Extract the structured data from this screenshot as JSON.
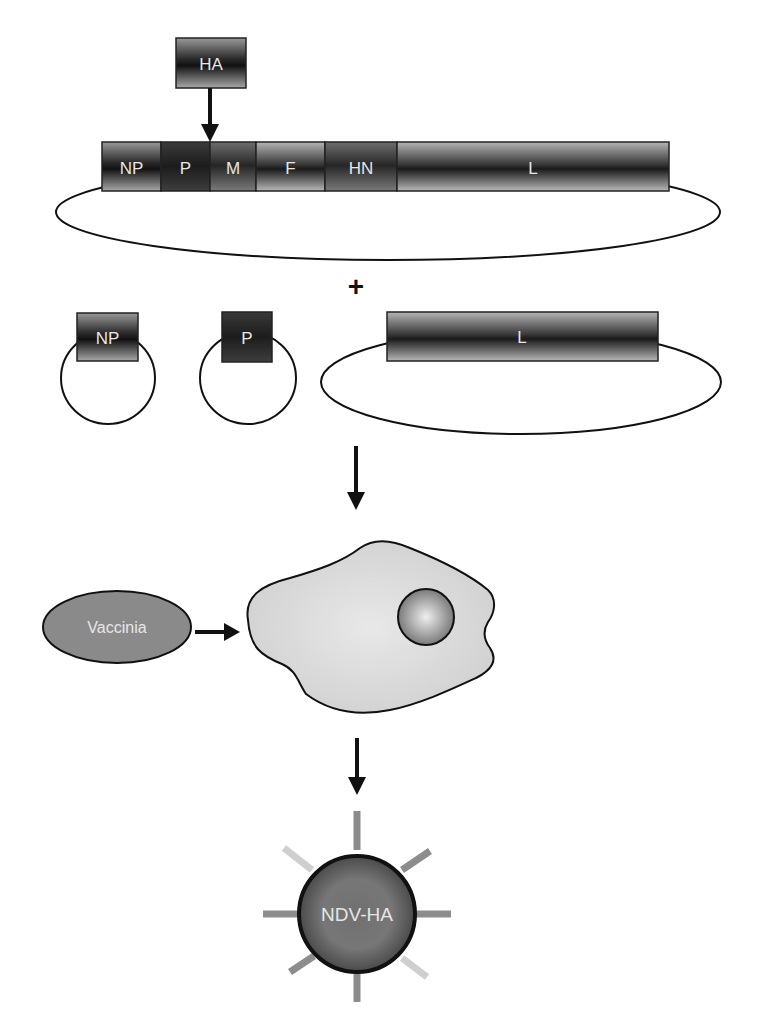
{
  "figure": {
    "insert_gene": {
      "label": "HA"
    },
    "genome_segments": [
      {
        "label": "NP",
        "x": 102,
        "w": 59,
        "shade": "mid"
      },
      {
        "label": "P",
        "x": 161,
        "w": 49,
        "shade": "dark"
      },
      {
        "label": "M",
        "x": 210,
        "w": 46,
        "shade": "darkmid"
      },
      {
        "label": "F",
        "x": 256,
        "w": 69,
        "shade": "light"
      },
      {
        "label": "HN",
        "x": 325,
        "w": 72,
        "shade": "darkmid"
      },
      {
        "label": "L",
        "x": 397,
        "w": 272,
        "shade": "light"
      }
    ],
    "plus_sign": "+",
    "helper_plasmids": [
      {
        "label": "NP"
      },
      {
        "label": "P"
      },
      {
        "label": "L"
      }
    ],
    "helper_virus": {
      "label": "Vaccinia"
    },
    "host_cell": {
      "label": ""
    },
    "product_virus": {
      "label": "NDV-HA"
    }
  },
  "colors": {
    "outline": "#111111",
    "cell_fill": "#d9d9d9",
    "vaccinia_fill": "#8a8a8a",
    "virion_fill": "#6e6e6e",
    "spike_mid": "#8c8c8c",
    "spike_light": "#cfcfcf",
    "label_text": "#e6e6e6"
  }
}
